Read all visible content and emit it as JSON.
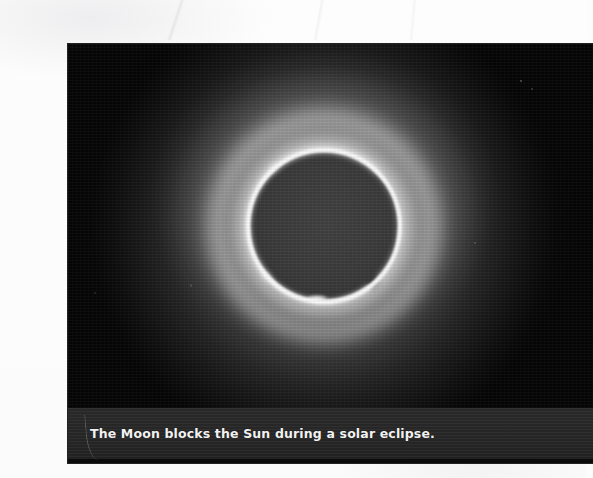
{
  "figure": {
    "kind": "photograph-with-caption",
    "caption": "The Moon blocks the Sun during a solar eclipse."
  },
  "photo": {
    "alt": "A bright ring of sunlight surrounds the dark silhouette of the Moon against a black sky",
    "sky_color": "#050505",
    "moon_color": "#3b3b3b",
    "corona_color": "#ffffff"
  },
  "caption": {
    "text": "The Moon blocks the Sun during a solar eclipse.",
    "band_color": "#272727",
    "text_color": "#f2f2f2"
  },
  "page": {
    "background_color": "#fcfcfc"
  }
}
